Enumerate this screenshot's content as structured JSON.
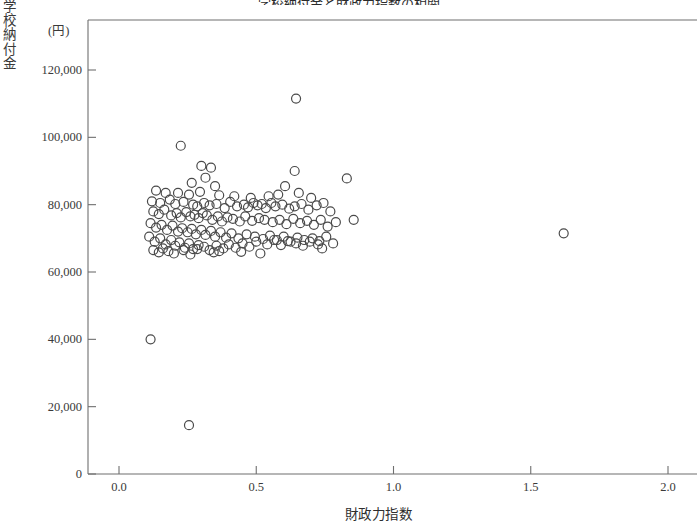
{
  "chart_data": {
    "type": "scatter",
    "title": "学校納付金と財政力指数の相関",
    "xlabel": "財政力指数",
    "ylabel": "学校納付金",
    "yunit": "(円)",
    "xlim": [
      0.0,
      2.0
    ],
    "ylim": [
      0,
      127500
    ],
    "xticks": [
      0.0,
      0.5,
      1.0,
      1.5,
      2.0
    ],
    "xtick_labels": [
      "0.0",
      "0.5",
      "1.0",
      "1.5",
      "2.0"
    ],
    "yticks": [
      0,
      20000,
      40000,
      60000,
      80000,
      100000,
      120000
    ],
    "ytick_labels": [
      "0",
      "20,000",
      "40,000",
      "60,000",
      "80,000",
      "100,000",
      "120,000"
    ],
    "grid": false,
    "legend": null,
    "marker": {
      "shape": "circle-open",
      "size": 9,
      "stroke": "#4a4a4a",
      "stroke_width": 1.2,
      "fill": "none"
    },
    "series": [
      {
        "name": "市区町村",
        "points": [
          [
            0.115,
            40000
          ],
          [
            0.255,
            14500
          ],
          [
            0.225,
            97500
          ],
          [
            0.645,
            111500
          ],
          [
            1.62,
            71500
          ],
          [
            0.3,
            91500
          ],
          [
            0.335,
            91000
          ],
          [
            0.315,
            88000
          ],
          [
            0.64,
            90000
          ],
          [
            0.83,
            87800
          ],
          [
            0.265,
            86500
          ],
          [
            0.35,
            85500
          ],
          [
            0.605,
            85500
          ],
          [
            0.135,
            84200
          ],
          [
            0.17,
            83500
          ],
          [
            0.215,
            83500
          ],
          [
            0.255,
            83000
          ],
          [
            0.295,
            83800
          ],
          [
            0.365,
            82800
          ],
          [
            0.42,
            82500
          ],
          [
            0.48,
            82000
          ],
          [
            0.545,
            82500
          ],
          [
            0.58,
            83000
          ],
          [
            0.655,
            83500
          ],
          [
            0.7,
            82000
          ],
          [
            0.12,
            81000
          ],
          [
            0.15,
            80500
          ],
          [
            0.185,
            81500
          ],
          [
            0.205,
            80200
          ],
          [
            0.235,
            80800
          ],
          [
            0.27,
            80000
          ],
          [
            0.285,
            79500
          ],
          [
            0.31,
            80500
          ],
          [
            0.33,
            79800
          ],
          [
            0.355,
            80200
          ],
          [
            0.385,
            79000
          ],
          [
            0.405,
            80800
          ],
          [
            0.43,
            79500
          ],
          [
            0.455,
            80000
          ],
          [
            0.47,
            79200
          ],
          [
            0.49,
            80500
          ],
          [
            0.505,
            79800
          ],
          [
            0.52,
            80200
          ],
          [
            0.535,
            79000
          ],
          [
            0.555,
            80500
          ],
          [
            0.57,
            79500
          ],
          [
            0.595,
            80000
          ],
          [
            0.62,
            78800
          ],
          [
            0.64,
            79500
          ],
          [
            0.665,
            80200
          ],
          [
            0.69,
            78500
          ],
          [
            0.72,
            79800
          ],
          [
            0.745,
            80500
          ],
          [
            0.77,
            78000
          ],
          [
            0.125,
            78000
          ],
          [
            0.145,
            77200
          ],
          [
            0.165,
            78500
          ],
          [
            0.19,
            76800
          ],
          [
            0.21,
            77500
          ],
          [
            0.225,
            76200
          ],
          [
            0.245,
            77800
          ],
          [
            0.26,
            76500
          ],
          [
            0.275,
            77000
          ],
          [
            0.29,
            76000
          ],
          [
            0.305,
            77500
          ],
          [
            0.32,
            76800
          ],
          [
            0.34,
            75500
          ],
          [
            0.36,
            76500
          ],
          [
            0.375,
            75000
          ],
          [
            0.395,
            76200
          ],
          [
            0.415,
            75800
          ],
          [
            0.44,
            75000
          ],
          [
            0.46,
            76500
          ],
          [
            0.485,
            75200
          ],
          [
            0.51,
            76000
          ],
          [
            0.53,
            75500
          ],
          [
            0.56,
            74800
          ],
          [
            0.585,
            75500
          ],
          [
            0.61,
            74200
          ],
          [
            0.635,
            75800
          ],
          [
            0.66,
            74500
          ],
          [
            0.685,
            75200
          ],
          [
            0.71,
            74000
          ],
          [
            0.735,
            75500
          ],
          [
            0.76,
            73500
          ],
          [
            0.79,
            74800
          ],
          [
            0.855,
            75500
          ],
          [
            0.115,
            74500
          ],
          [
            0.135,
            73200
          ],
          [
            0.155,
            74000
          ],
          [
            0.175,
            72500
          ],
          [
            0.195,
            73800
          ],
          [
            0.215,
            72000
          ],
          [
            0.23,
            73000
          ],
          [
            0.25,
            71800
          ],
          [
            0.265,
            72800
          ],
          [
            0.28,
            71200
          ],
          [
            0.3,
            72500
          ],
          [
            0.315,
            71000
          ],
          [
            0.335,
            72200
          ],
          [
            0.35,
            70500
          ],
          [
            0.37,
            71800
          ],
          [
            0.39,
            70200
          ],
          [
            0.41,
            71500
          ],
          [
            0.435,
            70000
          ],
          [
            0.465,
            71200
          ],
          [
            0.495,
            70500
          ],
          [
            0.525,
            69800
          ],
          [
            0.55,
            70800
          ],
          [
            0.575,
            69500
          ],
          [
            0.6,
            70500
          ],
          [
            0.625,
            69000
          ],
          [
            0.65,
            70200
          ],
          [
            0.675,
            69500
          ],
          [
            0.705,
            70000
          ],
          [
            0.73,
            69200
          ],
          [
            0.755,
            70500
          ],
          [
            0.78,
            68500
          ],
          [
            0.11,
            70500
          ],
          [
            0.13,
            69000
          ],
          [
            0.15,
            70000
          ],
          [
            0.17,
            68200
          ],
          [
            0.19,
            69500
          ],
          [
            0.205,
            67800
          ],
          [
            0.22,
            68800
          ],
          [
            0.24,
            67200
          ],
          [
            0.255,
            68500
          ],
          [
            0.27,
            66800
          ],
          [
            0.29,
            68000
          ],
          [
            0.31,
            67500
          ],
          [
            0.33,
            66500
          ],
          [
            0.355,
            67800
          ],
          [
            0.38,
            67000
          ],
          [
            0.4,
            68200
          ],
          [
            0.425,
            67200
          ],
          [
            0.45,
            68500
          ],
          [
            0.475,
            67500
          ],
          [
            0.5,
            69000
          ],
          [
            0.54,
            68200
          ],
          [
            0.565,
            69500
          ],
          [
            0.59,
            68000
          ],
          [
            0.615,
            69200
          ],
          [
            0.645,
            68500
          ],
          [
            0.67,
            67800
          ],
          [
            0.695,
            69000
          ],
          [
            0.725,
            68200
          ],
          [
            0.125,
            66500
          ],
          [
            0.145,
            65800
          ],
          [
            0.16,
            67000
          ],
          [
            0.18,
            66200
          ],
          [
            0.2,
            65500
          ],
          [
            0.235,
            66500
          ],
          [
            0.26,
            65200
          ],
          [
            0.285,
            66800
          ],
          [
            0.345,
            65800
          ],
          [
            0.365,
            66200
          ],
          [
            0.445,
            66000
          ],
          [
            0.515,
            65500
          ],
          [
            0.74,
            67000
          ]
        ]
      }
    ]
  }
}
